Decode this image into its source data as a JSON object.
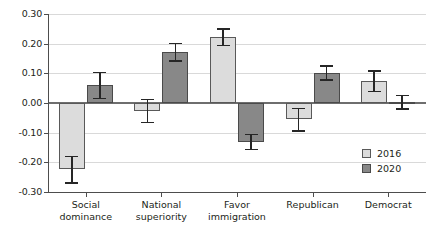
{
  "chart_data": {
    "type": "bar",
    "title": "",
    "subtitle": "",
    "xlabel": "",
    "ylabel": "",
    "ylim": [
      -0.3,
      0.3
    ],
    "ytick_values": [
      0.3,
      0.2,
      0.1,
      0.0,
      -0.1,
      -0.2,
      -0.3
    ],
    "ytick_labels": [
      "0.30",
      "0.20",
      "0.10",
      "0.00",
      "-0.10",
      "-0.20",
      "-0.30"
    ],
    "grid": true,
    "legend_position": "inside-lower-right",
    "categories": [
      "Social\ndominance",
      "National\nsuperiority",
      "Favor\nimmigration",
      "Republican",
      "Democrat"
    ],
    "category_labels_flat": [
      "Social dominance",
      "National superiority",
      "Favor immigration",
      "Republican",
      "Democrat"
    ],
    "series": [
      {
        "name": "2016",
        "color": "#dcdcdc",
        "values": [
          -0.222,
          -0.026,
          0.221,
          -0.055,
          0.075
        ],
        "errors_low": [
          -0.27,
          -0.066,
          0.193,
          -0.094,
          0.039
        ],
        "errors_high": [
          -0.18,
          0.011,
          0.249,
          -0.019,
          0.108
        ]
      },
      {
        "name": "2020",
        "color": "#888888",
        "values": [
          0.06,
          0.172,
          -0.133,
          0.101,
          0.003
        ],
        "errors_low": [
          0.016,
          0.141,
          -0.156,
          0.077,
          -0.021
        ],
        "errors_high": [
          0.102,
          0.201,
          -0.107,
          0.124,
          0.025
        ]
      }
    ]
  },
  "legend": {
    "items": [
      {
        "label": "2016",
        "color": "#dcdcdc"
      },
      {
        "label": "2020",
        "color": "#888888"
      }
    ]
  },
  "axis": {
    "y_ticks": [
      {
        "label": "0.30"
      },
      {
        "label": "0.20"
      },
      {
        "label": "0.10"
      },
      {
        "label": "0.00"
      },
      {
        "label": "-0.10"
      },
      {
        "label": "-0.20"
      },
      {
        "label": "-0.30"
      }
    ]
  }
}
